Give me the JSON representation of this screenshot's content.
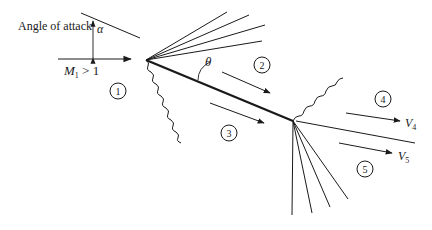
{
  "diagram": {
    "labels": {
      "angle_of_attack": "Angle of attack",
      "alpha": "α",
      "mach": "M",
      "mach_sub": "1",
      "mach_cond": " > 1",
      "theta": "θ",
      "v4": "V",
      "v4_sub": "4",
      "v5": "V",
      "v5_sub": "5"
    },
    "regions": [
      "1",
      "2",
      "3",
      "4",
      "5"
    ],
    "elements": {
      "plate": "flat plate",
      "leading_edge_expansion_fan_lines": 4,
      "leading_edge_shock": "oblique shock (lower surface)",
      "trailing_edge_shock": "oblique shock (upper surface)",
      "trailing_edge_expansion_fan_lines": 4,
      "slip_line": "slip line"
    },
    "colors": {
      "ink": "#1a1a1a",
      "background": "#ffffff"
    }
  }
}
